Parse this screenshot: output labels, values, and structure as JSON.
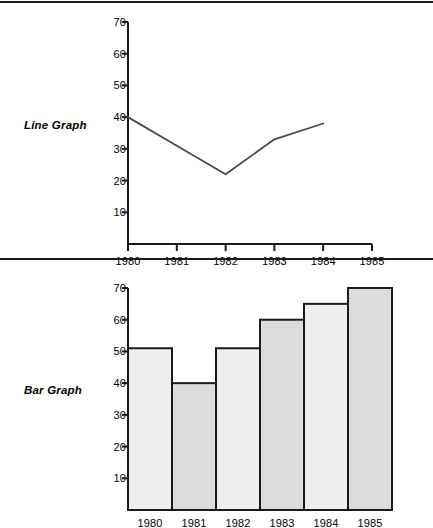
{
  "page": {
    "background": "#ffffff",
    "ink": "#1a1a1a"
  },
  "dividers": [
    {
      "name": "divider-top"
    },
    {
      "name": "divider-middle"
    }
  ],
  "panels": {
    "line": {
      "label": "Line Graph"
    },
    "bar": {
      "label": "Bar Graph"
    }
  },
  "chart_data": [
    {
      "type": "line",
      "title": "Line Graph",
      "xlabel": "",
      "ylabel": "",
      "categories": [
        "1980",
        "1981",
        "1982",
        "1983",
        "1984",
        "1985"
      ],
      "x": [
        1980,
        1981,
        1982,
        1983,
        1984
      ],
      "values": [
        40,
        31,
        22,
        33,
        38
      ],
      "series": [
        {
          "name": "Line Graph",
          "values": [
            40,
            31,
            22,
            33,
            38
          ]
        }
      ],
      "ylim": [
        0,
        74
      ],
      "xlim": [
        1980,
        1985
      ],
      "yticks": [
        70,
        60,
        50,
        40,
        30,
        20,
        10
      ],
      "xticks": [
        "1980",
        "1981",
        "1982",
        "1983",
        "1984",
        "1985"
      ],
      "grid": false,
      "legend": "none",
      "line_color": "#4a4a4a"
    },
    {
      "type": "bar",
      "title": "Bar Graph",
      "xlabel": "",
      "ylabel": "",
      "categories": [
        "1980",
        "1981",
        "1982",
        "1983",
        "1984",
        "1985"
      ],
      "values": [
        51,
        40,
        51,
        60,
        65,
        70
      ],
      "series": [
        {
          "name": "Bar Graph",
          "values": [
            51,
            40,
            51,
            60,
            65,
            70
          ]
        }
      ],
      "ylim": [
        0,
        74
      ],
      "yticks": [
        70,
        60,
        50,
        40,
        30,
        20,
        10
      ],
      "xticks": [
        "1980",
        "1981",
        "1982",
        "1983",
        "1984",
        "1985"
      ],
      "grid": false,
      "legend": "none",
      "bar_fill_light": "#eeeeee",
      "bar_fill_dark": "#dcdcdc",
      "bar_stroke": "#1a1a1a"
    }
  ]
}
